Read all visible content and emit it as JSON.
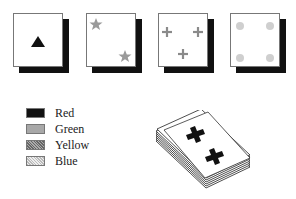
{
  "cards": [
    {
      "id": "card-1",
      "symbol": "triangle",
      "count": 1,
      "color": "red"
    },
    {
      "id": "card-2",
      "symbol": "star",
      "count": 2,
      "color": "green"
    },
    {
      "id": "card-3",
      "symbol": "cross",
      "count": 3,
      "color": "yellow"
    },
    {
      "id": "card-4",
      "symbol": "circle",
      "count": 4,
      "color": "blue"
    }
  ],
  "legend": {
    "items": [
      {
        "label": "Red",
        "pattern": "solid-black",
        "fill": "#111111"
      },
      {
        "label": "Green",
        "pattern": "medium-gray",
        "fill": "#a8a8a8"
      },
      {
        "label": "Yellow",
        "pattern": "dark-stipple",
        "fill": "#8a8a8a"
      },
      {
        "label": "Blue",
        "pattern": "light-stipple",
        "fill": "#d6d6d6"
      }
    ]
  },
  "deck": {
    "top_card_symbol": "cross",
    "top_card_count": 2,
    "top_card_color": "red"
  }
}
